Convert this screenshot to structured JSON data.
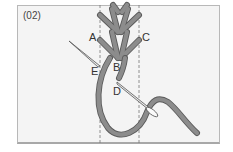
{
  "step_label": "(02)",
  "points": {
    "A": "A",
    "B": "B",
    "C": "C",
    "D": "D",
    "E": "E"
  },
  "colors": {
    "thread": "#8a8a8a",
    "thread_outline": "#5a5a5a",
    "background": "#f4f4f4",
    "guide_line": "#777777"
  }
}
